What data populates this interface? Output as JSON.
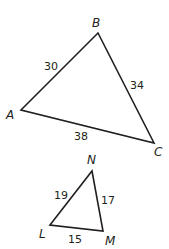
{
  "triangles": [
    {
      "name": "ABC",
      "vertices": {
        "A": {
          "label": "A",
          "x": 21,
          "y": 110
        },
        "B": {
          "label": "B",
          "x": 98,
          "y": 33
        },
        "C": {
          "label": "C",
          "x": 154,
          "y": 143
        }
      },
      "sides": {
        "AB": "30",
        "BC": "34",
        "AC": "38"
      }
    },
    {
      "name": "LMN",
      "vertices": {
        "L": {
          "label": "L",
          "x": 50,
          "y": 225
        },
        "M": {
          "label": "M",
          "x": 103,
          "y": 231
        },
        "N": {
          "label": "N",
          "x": 92,
          "y": 171
        }
      },
      "sides": {
        "LN": "19",
        "NM": "17",
        "LM": "15"
      }
    }
  ]
}
